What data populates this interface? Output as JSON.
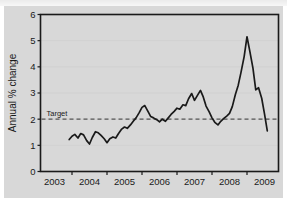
{
  "chart_data": {
    "type": "line",
    "title": "",
    "xlabel": "",
    "ylabel": "Annual % change",
    "xlim": [
      2002.6,
      2009.4
    ],
    "ylim": [
      0,
      6
    ],
    "grid": true,
    "legend": false,
    "xticks": [
      "2003",
      "2004",
      "2005",
      "2006",
      "2007",
      "2008",
      "2009"
    ],
    "xtick_values": [
      2003,
      2004,
      2005,
      2006,
      2007,
      2008,
      2009
    ],
    "yticks": [
      "0",
      "1",
      "2",
      "3",
      "4",
      "5",
      "6"
    ],
    "ytick_values": [
      0,
      1,
      2,
      3,
      4,
      5,
      6
    ],
    "annotations": [
      {
        "label": "Target",
        "type": "hline",
        "value": 2.0,
        "style": "dashed",
        "color": "#555555"
      }
    ],
    "series": [
      {
        "name": "Annual % change",
        "color": "#1a1a1a",
        "x": [
          2003.42,
          2003.5,
          2003.58,
          2003.67,
          2003.75,
          2003.83,
          2003.92,
          2004.0,
          2004.08,
          2004.17,
          2004.25,
          2004.33,
          2004.42,
          2004.5,
          2004.58,
          2004.67,
          2004.75,
          2004.83,
          2004.92,
          2005.0,
          2005.08,
          2005.17,
          2005.25,
          2005.33,
          2005.42,
          2005.5,
          2005.58,
          2005.67,
          2005.75,
          2005.83,
          2005.92,
          2006.0,
          2006.08,
          2006.17,
          2006.25,
          2006.33,
          2006.42,
          2006.5,
          2006.58,
          2006.67,
          2006.75,
          2006.83,
          2006.92,
          2007.0,
          2007.08,
          2007.17,
          2007.25,
          2007.33,
          2007.42,
          2007.5,
          2007.58,
          2007.67,
          2007.75,
          2007.83,
          2007.92,
          2008.0,
          2008.08,
          2008.17,
          2008.25,
          2008.33,
          2008.42,
          2008.5,
          2008.58,
          2008.67,
          2008.75,
          2008.83,
          2008.92,
          2009.0,
          2009.08
        ],
        "values": [
          1.22,
          1.35,
          1.42,
          1.28,
          1.45,
          1.4,
          1.18,
          1.05,
          1.3,
          1.52,
          1.48,
          1.38,
          1.25,
          1.1,
          1.25,
          1.32,
          1.28,
          1.45,
          1.62,
          1.7,
          1.65,
          1.78,
          1.92,
          2.05,
          2.25,
          2.45,
          2.52,
          2.3,
          2.1,
          2.05,
          1.98,
          1.9,
          2.0,
          1.92,
          2.05,
          2.18,
          2.3,
          2.42,
          2.38,
          2.55,
          2.52,
          2.78,
          2.98,
          2.72,
          2.9,
          3.1,
          2.85,
          2.5,
          2.28,
          2.05,
          1.88,
          1.78,
          1.92,
          2.02,
          2.12,
          2.22,
          2.48,
          2.95,
          3.3,
          3.8,
          4.4,
          5.15,
          4.6,
          3.95,
          3.12,
          3.2,
          2.8,
          2.2,
          1.55
        ]
      }
    ]
  },
  "axes": {
    "ylabel": "Annual % change",
    "target_label": "Target"
  }
}
